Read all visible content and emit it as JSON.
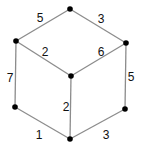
{
  "diagram": {
    "type": "weighted-graph-cube",
    "colors": {
      "edge": "#8c8c8c",
      "node": "#000000",
      "label": "#111111",
      "background": "#ffffff"
    },
    "nodes": [
      {
        "id": "top",
        "x": 70,
        "y": 9
      },
      {
        "id": "upper-left",
        "x": 16,
        "y": 41
      },
      {
        "id": "upper-right",
        "x": 126,
        "y": 43
      },
      {
        "id": "center",
        "x": 71,
        "y": 76
      },
      {
        "id": "lower-left",
        "x": 15,
        "y": 107
      },
      {
        "id": "lower-right",
        "x": 125,
        "y": 109
      },
      {
        "id": "bottom",
        "x": 70,
        "y": 139
      }
    ],
    "edges": [
      {
        "from": "upper-left",
        "to": "top",
        "weight": "5",
        "lx": 40,
        "ly": 18
      },
      {
        "from": "top",
        "to": "upper-right",
        "weight": "3",
        "lx": 101,
        "ly": 19
      },
      {
        "from": "upper-left",
        "to": "center",
        "weight": "2",
        "lx": 45,
        "ly": 52
      },
      {
        "from": "center",
        "to": "upper-right",
        "weight": "6",
        "lx": 101,
        "ly": 52
      },
      {
        "from": "upper-left",
        "to": "lower-left",
        "weight": "7",
        "lx": 10,
        "ly": 78
      },
      {
        "from": "upper-right",
        "to": "lower-right",
        "weight": "5",
        "lx": 131,
        "ly": 77
      },
      {
        "from": "center",
        "to": "bottom",
        "weight": "2",
        "lx": 66,
        "ly": 107
      },
      {
        "from": "lower-left",
        "to": "bottom",
        "weight": "1",
        "lx": 39,
        "ly": 135
      },
      {
        "from": "bottom",
        "to": "lower-right",
        "weight": "3",
        "lx": 106,
        "ly": 135
      }
    ]
  }
}
